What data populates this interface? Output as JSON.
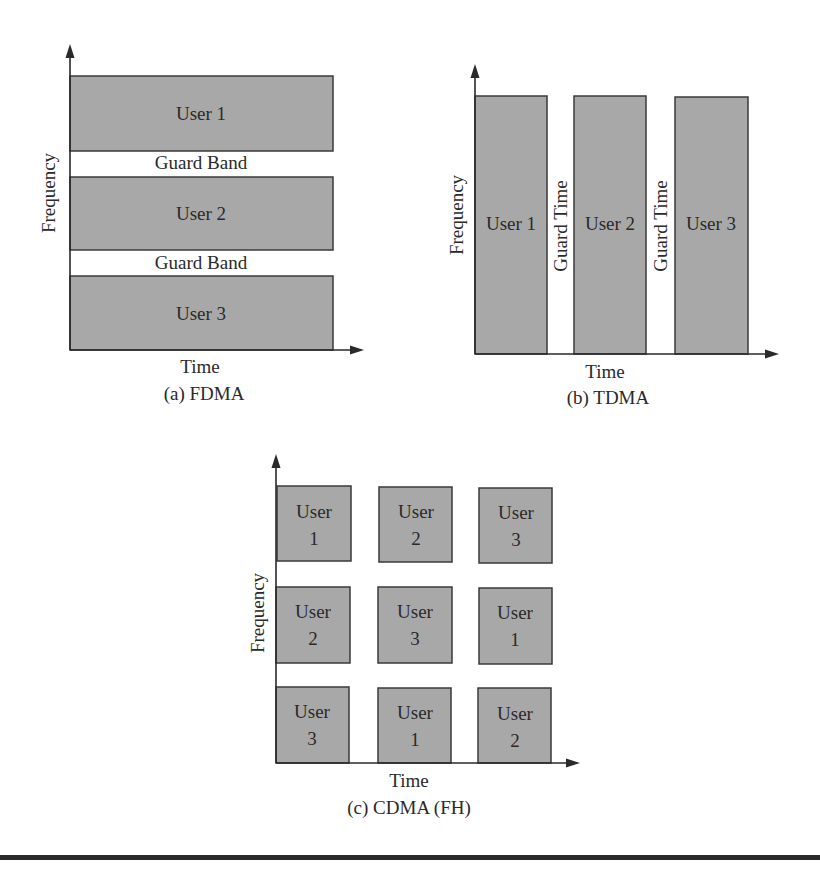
{
  "figure": {
    "panels": [
      {
        "id": "a",
        "caption": "(a) FDMA",
        "xlabel": "Time",
        "ylabel": "Frequency",
        "blocks": [
          {
            "label": "User 1"
          },
          {
            "label": "User 2"
          },
          {
            "label": "User 3"
          }
        ],
        "guards": [
          "Guard Band",
          "Guard Band"
        ]
      },
      {
        "id": "b",
        "caption": "(b) TDMA",
        "xlabel": "Time",
        "ylabel": "Frequency",
        "blocks": [
          {
            "label": "User 1"
          },
          {
            "label": "User 2"
          },
          {
            "label": "User 3"
          }
        ],
        "guards": [
          "Guard Time",
          "Guard Time"
        ]
      },
      {
        "id": "c",
        "caption": "(c) CDMA (FH)",
        "xlabel": "Time",
        "ylabel": "Frequency",
        "grid": [
          [
            {
              "word": "User",
              "num": "1"
            },
            {
              "word": "User",
              "num": "2"
            },
            {
              "word": "User",
              "num": "3"
            }
          ],
          [
            {
              "word": "User",
              "num": "2"
            },
            {
              "word": "User",
              "num": "3"
            },
            {
              "word": "User",
              "num": "1"
            }
          ],
          [
            {
              "word": "User",
              "num": "3"
            },
            {
              "word": "User",
              "num": "1"
            },
            {
              "word": "User",
              "num": "2"
            }
          ]
        ]
      }
    ],
    "colors": {
      "block_fill": "#a8a8a8",
      "stroke": "#2a2a2a"
    }
  }
}
